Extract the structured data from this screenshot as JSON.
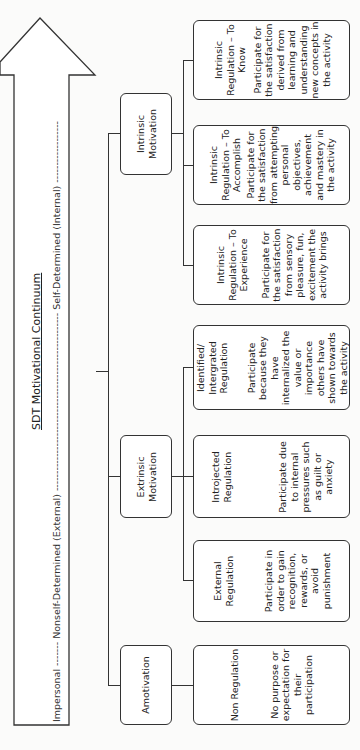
{
  "diagram": {
    "title": "SDT Motivational Continuum",
    "arrow": {
      "label_start": "Impersonal",
      "label_middle": "Nonself-Determined (External)",
      "label_end": "Self-Determined (Internal)",
      "full_label": "Impersonal -------- Nonself-Determined (External) ---------------------------------------------------- Self-Determined (Internal) ----------"
    },
    "categories": [
      {
        "label": "Amotivation",
        "regulations": [
          {
            "title": "Non Regulation",
            "description": "No purpose or expectation for their participation"
          }
        ]
      },
      {
        "label": "Extrinsic Motivation",
        "regulations": [
          {
            "title": "External Regulation",
            "description": "Participate in order to gain recognition, rewards, or avoid punishment"
          },
          {
            "title": "Introjected Regulation",
            "description": "Participate due to internal pressures such as guilt or anxiety"
          },
          {
            "title": "Identified/ Intergrated Regulation",
            "description": "Participate because they have internalized the value or importance others have shown towards the activity"
          }
        ]
      },
      {
        "label": "Intrinsic Motivation",
        "regulations": [
          {
            "title": "Intrinsic Regulation – To Experience",
            "description": "Participate for the satisfaction from sensory pleasure, fun, excitement the activity brings"
          },
          {
            "title": "Intrinsic Regulation – To Accomplish",
            "description": "Participate for the satisfaction from attempting personal objectives, achievement and mastery in the activity"
          },
          {
            "title": "Intrinsic Regulation – To Know",
            "description": "Participate for the satisfaction derived from learning and understanding new concepts in the activity"
          }
        ]
      }
    ]
  }
}
